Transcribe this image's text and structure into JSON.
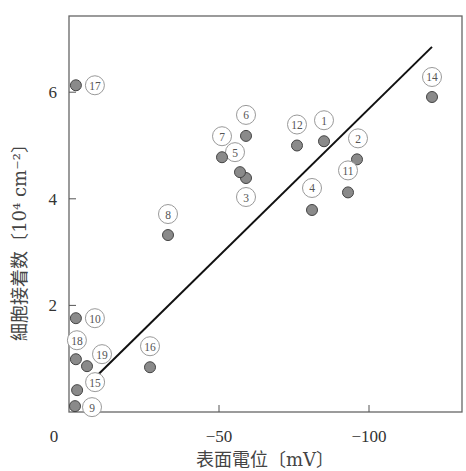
{
  "chart_data": {
    "type": "scatter",
    "title": "",
    "xlabel": "表面電位〔mV〕",
    "ylabel": "細胞接着数〔10⁴ cm⁻²〕",
    "xlim": [
      0,
      -130
    ],
    "ylim": [
      0,
      7.4
    ],
    "x_ticks": [
      {
        "value": 0,
        "label": "0"
      },
      {
        "value": -50,
        "label": "−50"
      },
      {
        "value": -100,
        "label": "−100"
      }
    ],
    "y_ticks": [
      {
        "value": 2,
        "label": "2"
      },
      {
        "value": 4,
        "label": "4"
      },
      {
        "value": 6,
        "label": "6"
      }
    ],
    "grid": false,
    "legend": null,
    "marker_color": "#8a8a8a",
    "points": [
      {
        "id": "1",
        "label": "①",
        "x": -85,
        "y": 5.08
      },
      {
        "id": "2",
        "label": "②",
        "x": -96,
        "y": 4.74
      },
      {
        "id": "3",
        "label": "③",
        "x": -59,
        "y": 4.39
      },
      {
        "id": "4",
        "label": "④",
        "x": -81,
        "y": 3.79
      },
      {
        "id": "5",
        "label": "⑤",
        "x": -57,
        "y": 4.5
      },
      {
        "id": "6",
        "label": "⑥",
        "x": -59,
        "y": 5.18
      },
      {
        "id": "7",
        "label": "⑦",
        "x": -51,
        "y": 4.78
      },
      {
        "id": "8",
        "label": "⑧",
        "x": -33,
        "y": 3.32
      },
      {
        "id": "9",
        "label": "⑨",
        "x": -2,
        "y": 0.11
      },
      {
        "id": "10",
        "label": "⑩",
        "x": -2.3,
        "y": 1.76
      },
      {
        "id": "11",
        "label": "⑪",
        "x": -93,
        "y": 4.12
      },
      {
        "id": "12",
        "label": "⑫",
        "x": -76,
        "y": 5.0
      },
      {
        "id": "14",
        "label": "⑭",
        "x": -121,
        "y": 5.91
      },
      {
        "id": "15",
        "label": "⑮",
        "x": -2.7,
        "y": 0.41
      },
      {
        "id": "16",
        "label": "⑯",
        "x": -27,
        "y": 0.84
      },
      {
        "id": "17",
        "label": "⑰",
        "x": -2.3,
        "y": 6.13
      },
      {
        "id": "18",
        "label": "⑱",
        "x": -2.3,
        "y": 0.99
      },
      {
        "id": "19",
        "label": "⑲",
        "x": -6,
        "y": 0.86
      }
    ],
    "fit_line": {
      "x1": -9.3,
      "y1": 0.68,
      "x2": -121,
      "y2": 6.85
    }
  }
}
